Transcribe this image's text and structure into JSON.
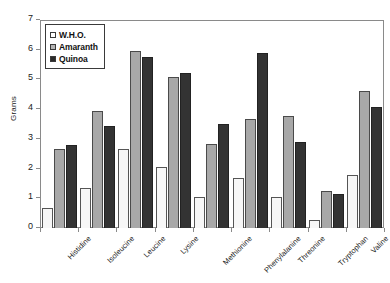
{
  "chart_data": {
    "type": "bar",
    "title": "",
    "xlabel": "",
    "ylabel": "Grams",
    "ylim": [
      0,
      7
    ],
    "ytick_labels": [
      "0",
      "1",
      "2",
      "3",
      "4",
      "5",
      "6",
      "7"
    ],
    "ytick_values": [
      0,
      1,
      2,
      3,
      4,
      5,
      6,
      7
    ],
    "grid": false,
    "legend_position": "top-left",
    "categories": [
      "Histidine",
      "Isoleucine",
      "Leucine",
      "Lysine",
      "Methionine",
      "Phenylalanine",
      "Threonine",
      "Tryptophan",
      "Valine"
    ],
    "series": [
      {
        "name": "W.H.O.",
        "color": "#ffffff",
        "values": [
          0.68,
          1.35,
          2.66,
          2.07,
          1.03,
          1.7,
          1.03,
          0.27,
          1.78
        ]
      },
      {
        "name": "Amaranth",
        "color": "#b5b5b5",
        "values": [
          2.65,
          3.94,
          5.96,
          5.07,
          2.83,
          3.67,
          3.78,
          1.25,
          4.61
        ]
      },
      {
        "name": "Quinoa",
        "color": "#2a2a2a",
        "values": [
          2.79,
          3.44,
          5.74,
          5.22,
          3.5,
          5.89,
          2.88,
          1.15,
          4.07
        ]
      }
    ]
  }
}
